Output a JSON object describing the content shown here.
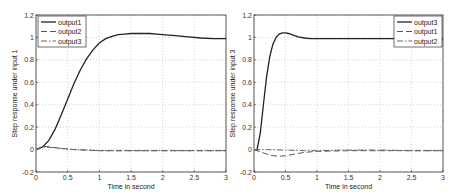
{
  "chart_data": [
    {
      "type": "line",
      "xlabel": "Time in second",
      "ylabel": "Step response under input 1",
      "xlim": [
        0,
        3
      ],
      "ylim": [
        -0.2,
        1.2
      ],
      "xticks": [
        "0",
        "0.5",
        "1",
        "1.5",
        "2",
        "2.5",
        "3"
      ],
      "yticks": [
        "-0.2",
        "0",
        "0.2",
        "0.4",
        "0.6",
        "0.8",
        "1",
        "1.2"
      ],
      "grid": true,
      "legend_position": "upper left",
      "legend": [
        "output1",
        "output2",
        "output3"
      ],
      "series": [
        {
          "name": "output1",
          "style": "solid",
          "x": [
            0,
            0.1,
            0.2,
            0.3,
            0.4,
            0.5,
            0.6,
            0.7,
            0.8,
            0.9,
            1.0,
            1.1,
            1.2,
            1.3,
            1.4,
            1.5,
            1.6,
            1.7,
            1.8,
            1.9,
            2.0,
            2.2,
            2.4,
            2.6,
            2.8,
            3.0
          ],
          "values": [
            0,
            0.02,
            0.08,
            0.18,
            0.31,
            0.45,
            0.59,
            0.71,
            0.81,
            0.89,
            0.95,
            0.99,
            1.01,
            1.025,
            1.03,
            1.035,
            1.035,
            1.035,
            1.035,
            1.03,
            1.025,
            1.015,
            1.005,
            0.995,
            0.99,
            0.99
          ]
        },
        {
          "name": "output2",
          "style": "dashed",
          "x": [
            0,
            0.1,
            0.2,
            0.4,
            0.6,
            0.8,
            1.0,
            1.5,
            2.0,
            2.5,
            3.0
          ],
          "values": [
            0,
            0.03,
            0.025,
            0.01,
            0.0,
            -0.005,
            -0.01,
            -0.01,
            -0.01,
            -0.01,
            -0.01
          ]
        },
        {
          "name": "output3",
          "style": "dashdot",
          "x": [
            0,
            0.1,
            0.2,
            0.4,
            0.6,
            0.8,
            1.0,
            1.5,
            2.0,
            2.5,
            3.0
          ],
          "values": [
            0,
            0.02,
            0.02,
            0.01,
            0.0,
            -0.005,
            -0.01,
            -0.01,
            -0.01,
            -0.01,
            -0.01
          ]
        }
      ]
    },
    {
      "type": "line",
      "xlabel": "Time in second",
      "ylabel": "Step response under input 3",
      "xlim": [
        0,
        3
      ],
      "ylim": [
        -0.2,
        1.2
      ],
      "xticks": [
        "0",
        "0.5",
        "1",
        "1.5",
        "2",
        "2.5",
        "3"
      ],
      "yticks": [
        "-0.2",
        "0",
        "0.2",
        "0.4",
        "0.6",
        "0.8",
        "1",
        "1.2"
      ],
      "grid": true,
      "legend_position": "upper right",
      "legend": [
        "output3",
        "output1",
        "output2"
      ],
      "series": [
        {
          "name": "output3",
          "style": "solid",
          "x": [
            0,
            0.05,
            0.1,
            0.15,
            0.2,
            0.25,
            0.3,
            0.35,
            0.4,
            0.45,
            0.5,
            0.55,
            0.6,
            0.7,
            0.8,
            0.9,
            1.0,
            1.5,
            2.0,
            2.5,
            3.0
          ],
          "values": [
            0,
            0.0,
            0.15,
            0.4,
            0.65,
            0.83,
            0.94,
            1.0,
            1.03,
            1.04,
            1.04,
            1.035,
            1.025,
            1.005,
            0.995,
            0.99,
            0.99,
            0.99,
            0.99,
            0.99,
            0.99
          ]
        },
        {
          "name": "output1",
          "style": "dashed",
          "x": [
            0,
            0.1,
            0.2,
            0.3,
            0.4,
            0.5,
            0.6,
            0.8,
            1.0,
            1.5,
            2.0,
            2.5,
            3.0
          ],
          "values": [
            0,
            -0.02,
            -0.04,
            -0.055,
            -0.06,
            -0.055,
            -0.045,
            -0.025,
            -0.015,
            -0.01,
            -0.01,
            -0.01,
            -0.01
          ]
        },
        {
          "name": "output2",
          "style": "dashdot",
          "x": [
            0,
            0.2,
            0.5,
            0.8,
            1.0,
            1.5,
            2.0,
            2.5,
            3.0
          ],
          "values": [
            0,
            0.0,
            -0.005,
            -0.01,
            -0.01,
            -0.005,
            -0.005,
            -0.01,
            -0.01
          ]
        }
      ]
    }
  ]
}
